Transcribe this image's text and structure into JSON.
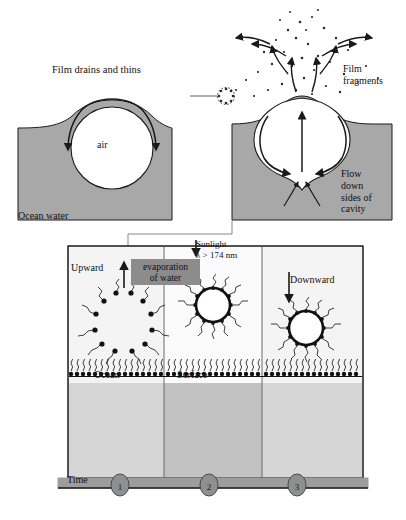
{
  "figure": {
    "colors": {
      "ocean_water_fill": "#a8a8a8",
      "panel_light_fill": "#d6d6d6",
      "panel_mid_fill": "#c2c2c2",
      "time_bar_fill": "#9d9d9d",
      "label_box_fill": "#8c8c8c",
      "stroke": "#1a1a1a",
      "air_fill": "#ffffff"
    }
  },
  "top_left_panel": {
    "name": "film-drains-panel",
    "caption": "Film drains and thins",
    "air_label": "air",
    "water_label": "Ocean water"
  },
  "top_right_panel": {
    "name": "bubble-burst-panel",
    "fragments_label": "Film\nfragments",
    "flow_label": "Flow\ndown\nsides of\ncavity"
  },
  "lower_panel": {
    "name": "micelle-cycle-panel",
    "ocean_label": "Ocean",
    "surface_label": "Surface",
    "time_label": "Time",
    "columns": [
      {
        "index": 1,
        "step_number": "1",
        "direction_label": "Upward",
        "direction": "up",
        "micelle_state": "dispersed-surfactant-ring"
      },
      {
        "index": 2,
        "step_number": "2",
        "direction_label": "evaporation\nof water",
        "direction": "down",
        "micelle_state": "compact-micelle",
        "sunlight_label": "Sunlight",
        "sunlight_wavelength": "λ > 174 nm"
      },
      {
        "index": 3,
        "step_number": "3",
        "direction_label": "Downward",
        "direction": "down",
        "micelle_state": "compact-micelle"
      }
    ]
  }
}
